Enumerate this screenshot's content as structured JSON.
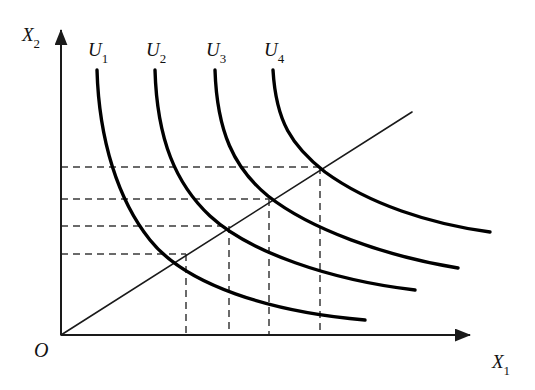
{
  "figure": {
    "type": "economics-indifference-curve-diagram",
    "background_color": "#ffffff",
    "width": 535,
    "height": 390
  },
  "axes": {
    "x": {
      "label_base": "X",
      "label_sub": "1",
      "label_x": 492,
      "label_y": 352,
      "line": {
        "x1": 61,
        "y1": 335,
        "x2": 470,
        "y2": 335
      },
      "arrow": true,
      "color": "#1a1a1a",
      "width": 2
    },
    "y": {
      "label_base": "X",
      "label_sub": "2",
      "label_x": 22,
      "label_y": 25,
      "line": {
        "x1": 61,
        "y1": 335,
        "x2": 61,
        "y2": 30
      },
      "arrow": true,
      "color": "#1a1a1a",
      "width": 2
    },
    "origin": {
      "label": "O",
      "label_x": 34,
      "label_y": 340,
      "x": 61,
      "y": 335
    }
  },
  "ray": {
    "name": "forty-five-degree-ray",
    "x1": 61,
    "y1": 335,
    "x2": 412,
    "y2": 112,
    "color": "#1a1a1a",
    "width": 1.6
  },
  "curves": [
    {
      "id": "U1",
      "label_base": "U",
      "label_sub": "1",
      "label_x": 88,
      "label_y": 40,
      "color": "#000000",
      "width": 3.4,
      "path": "M 97,70 C 99,140 118,200 150,240 C 186,285 270,312 365,320",
      "intersection": {
        "x": 186,
        "y": 254
      }
    },
    {
      "id": "U2",
      "label_base": "U",
      "label_sub": "2",
      "label_x": 146,
      "label_y": 40,
      "color": "#000000",
      "width": 3.4,
      "path": "M 155,70 C 157,140 176,184 210,216 C 249,252 330,280 415,290",
      "intersection": {
        "x": 229,
        "y": 226
      }
    },
    {
      "id": "U3",
      "label_base": "U",
      "label_sub": "3",
      "label_x": 206,
      "label_y": 40,
      "color": "#000000",
      "width": 3.4,
      "path": "M 215,70 C 217,132 234,168 268,196 C 310,229 384,256 458,268",
      "intersection": {
        "x": 269,
        "y": 199
      }
    },
    {
      "id": "U4",
      "label_base": "U",
      "label_sub": "4",
      "label_x": 264,
      "label_y": 40,
      "color": "#000000",
      "width": 3.4,
      "path": "M 273,70 C 276,122 292,146 325,172 C 369,204 430,224 490,232",
      "intersection": {
        "x": 320,
        "y": 167
      }
    }
  ],
  "guide_lines": {
    "color": "#3a3a3a",
    "width": 1.5,
    "dash": "7,5",
    "horizontal": [
      {
        "x1": 61,
        "y": 167,
        "x2": 320
      },
      {
        "x1": 61,
        "y": 199,
        "x2": 269
      },
      {
        "x1": 61,
        "y": 226,
        "x2": 229
      },
      {
        "x1": 61,
        "y": 254,
        "x2": 186
      }
    ],
    "vertical": [
      {
        "x": 186,
        "y1": 254,
        "y2": 335
      },
      {
        "x": 229,
        "y1": 226,
        "y2": 335
      },
      {
        "x": 269,
        "y1": 199,
        "y2": 335
      },
      {
        "x": 320,
        "y1": 167,
        "y2": 335
      }
    ]
  }
}
